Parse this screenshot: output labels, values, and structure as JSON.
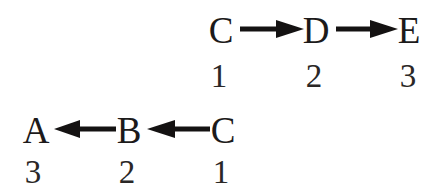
{
  "diagram": {
    "background_color": "#ffffff",
    "ink_color": "#1c1a1a",
    "rows": [
      {
        "id": "top-chain",
        "direction": "right",
        "nodes": [
          {
            "label": "C",
            "index": "1"
          },
          {
            "label": "D",
            "index": "2"
          },
          {
            "label": "E",
            "index": "3"
          }
        ],
        "arrows": [
          {
            "from": "C",
            "to": "D",
            "glyph": "arrow-right"
          },
          {
            "from": "D",
            "to": "E",
            "glyph": "arrow-right"
          }
        ]
      },
      {
        "id": "bottom-chain",
        "direction": "left",
        "nodes": [
          {
            "label": "A",
            "index": "3"
          },
          {
            "label": "B",
            "index": "2"
          },
          {
            "label": "C",
            "index": "1"
          }
        ],
        "arrows": [
          {
            "from": "B",
            "to": "A",
            "glyph": "arrow-left"
          },
          {
            "from": "C",
            "to": "B",
            "glyph": "arrow-left"
          }
        ]
      }
    ]
  }
}
